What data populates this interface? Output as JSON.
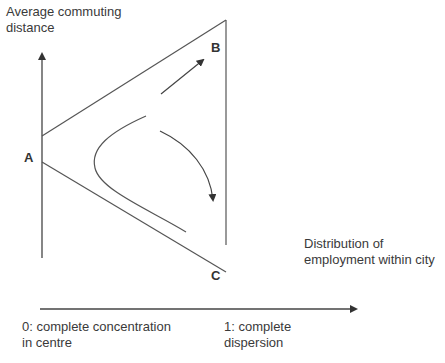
{
  "diagram": {
    "y_axis_label_line1": "Average commuting",
    "y_axis_label_line2": "distance",
    "x_axis_label_line1": "Distribution of",
    "x_axis_label_line2": "employment within city",
    "x_min_label_line1": "0: complete concentration",
    "x_min_label_line2": "in centre",
    "x_max_label_line1": "1: complete",
    "x_max_label_line2": "dispersion",
    "point_a": "A",
    "point_b": "B",
    "point_c": "C",
    "line_color": "#555555"
  }
}
